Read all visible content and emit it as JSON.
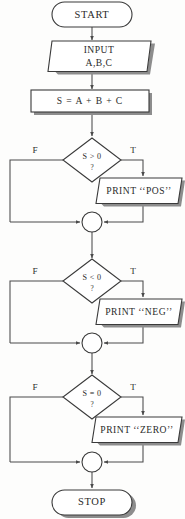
{
  "diagram": {
    "type": "flowchart",
    "colors": {
      "background": "#fdfdfc",
      "stroke": "#3a3a3a",
      "connector": "#4a4a4a",
      "shadow": "#8d8d8d",
      "text": "#2b2b2b",
      "shape_fill": "#ffffff"
    },
    "nodes": {
      "start": {
        "label": "START",
        "shape": "terminator"
      },
      "input": {
        "label_line1": "INPUT",
        "label_line2": "A,B,C",
        "shape": "parallelogram"
      },
      "sum": {
        "label": "S = A + B + C",
        "shape": "process"
      },
      "decision_pos": {
        "label": "S > 0",
        "question_mark": "?",
        "shape": "diamond"
      },
      "print_pos": {
        "label": "PRINT ‘‘POS’’",
        "shape": "parallelogram"
      },
      "decision_neg": {
        "label": "S < 0",
        "question_mark": "?",
        "shape": "diamond"
      },
      "print_neg": {
        "label": "PRINT ‘‘NEG’’",
        "shape": "parallelogram"
      },
      "decision_zero": {
        "label": "S = 0",
        "question_mark": "?",
        "shape": "diamond"
      },
      "print_zero": {
        "label": "PRINT ‘‘ZERO’’",
        "shape": "parallelogram"
      },
      "merge_1": {
        "shape": "connector-circle"
      },
      "merge_2": {
        "shape": "connector-circle"
      },
      "merge_3": {
        "shape": "connector-circle"
      },
      "stop": {
        "label": "STOP",
        "shape": "terminator"
      }
    },
    "branch_labels": {
      "false_1": "F",
      "true_1": "T",
      "false_2": "F",
      "true_2": "T",
      "false_3": "F",
      "true_3": "T"
    }
  }
}
